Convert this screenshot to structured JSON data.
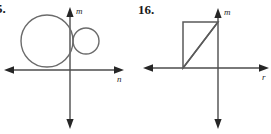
{
  "document": {
    "type": "math-worksheet-figures",
    "panel_count": 2,
    "background_color": "#ffffff",
    "ink_color": "#4d4d4d",
    "text_color": "#1a1a1a"
  },
  "panels": [
    {
      "id": "left",
      "number_label": "5.",
      "number_label_clipped": true,
      "figure_name": "two-tangent-circles-on-axes",
      "axes": {
        "horizontal_label": "n",
        "vertical_label": "m",
        "origin": {
          "x": 70,
          "y": 70
        },
        "horizontal_arrow_left": true,
        "horizontal_arrow_right": true,
        "vertical_arrow_up": true,
        "vertical_arrow_down": true
      },
      "shapes": [
        {
          "name": "large-circle",
          "type": "circle",
          "cx": 47,
          "cy": 41,
          "r": 26
        },
        {
          "name": "small-circle",
          "type": "circle",
          "cx": 86,
          "cy": 41,
          "r": 13
        }
      ]
    },
    {
      "id": "right",
      "number_label": "16.",
      "number_label_clipped": false,
      "figure_name": "right-triangle-in-second-quadrant",
      "axes": {
        "horizontal_label": "r",
        "vertical_label": "m",
        "origin": {
          "x": 83,
          "y": 68
        },
        "horizontal_arrow_left": true,
        "horizontal_arrow_right": true,
        "vertical_arrow_up": true,
        "vertical_arrow_down": true
      },
      "shapes": [
        {
          "name": "triangle",
          "type": "polygon",
          "points": "48,22 83,22 48,68",
          "vertices": [
            {
              "x": 48,
              "y": 22
            },
            {
              "x": 83,
              "y": 22
            },
            {
              "x": 48,
              "y": 68
            }
          ]
        },
        {
          "name": "triangle-hypotenuse",
          "type": "line",
          "x1": 48,
          "y1": 68,
          "x2": 83,
          "y2": 22
        }
      ]
    }
  ]
}
